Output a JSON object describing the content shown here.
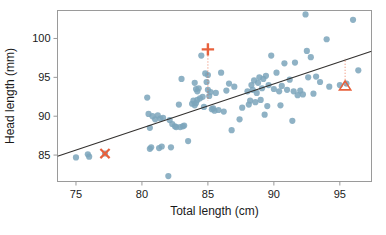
{
  "chart_data": {
    "type": "scatter",
    "title": "",
    "xlabel": "Total length (cm)",
    "ylabel": "Head length (mm)",
    "xlim": [
      73.6,
      97.4
    ],
    "ylim": [
      81.6,
      103.6
    ],
    "xticks": [
      75,
      80,
      85,
      90,
      95
    ],
    "yticks": [
      85,
      90,
      95,
      100
    ],
    "xtick_labels": [
      "75",
      "80",
      "85",
      "90",
      "95"
    ],
    "ytick_labels": [
      "85",
      "90",
      "95",
      "100"
    ],
    "grid": false,
    "legend": "none",
    "point_color": "#7ba4bb",
    "point_opacity": 0.85,
    "point_radius": 3.1,
    "highlight_color": "#e8613c",
    "line_color": "#33312f",
    "frame_color": "#9a9a9a",
    "series": [
      {
        "name": "possums",
        "x": [
          75.0,
          75.9,
          76.0,
          77.2,
          80.4,
          80.5,
          80.6,
          80.6,
          80.7,
          80.8,
          81.0,
          81.2,
          81.3,
          81.4,
          81.5,
          81.6,
          82.0,
          82.1,
          82.2,
          82.3,
          82.5,
          82.6,
          82.8,
          82.9,
          83.0,
          83.1,
          83.2,
          83.5,
          83.8,
          83.9,
          84.0,
          84.0,
          84.1,
          84.1,
          84.2,
          84.2,
          84.3,
          84.4,
          84.5,
          84.6,
          84.7,
          84.8,
          84.9,
          85.0,
          85.0,
          85.1,
          85.2,
          85.3,
          85.4,
          85.5,
          85.6,
          85.8,
          86.0,
          86.2,
          86.4,
          86.6,
          86.8,
          87.0,
          87.4,
          87.6,
          88.0,
          88.1,
          88.2,
          88.3,
          88.4,
          88.5,
          88.6,
          88.7,
          88.8,
          88.9,
          89.0,
          89.1,
          89.2,
          89.3,
          89.4,
          89.5,
          89.6,
          89.8,
          90.0,
          90.2,
          90.4,
          90.5,
          90.6,
          90.8,
          91.0,
          91.2,
          91.4,
          91.5,
          91.6,
          91.8,
          92.0,
          92.2,
          92.4,
          92.5,
          92.6,
          92.8,
          93.0,
          93.2,
          93.5,
          94.0,
          94.2,
          95.0,
          95.5,
          96.0,
          96.4
        ],
        "y": [
          84.7,
          85.1,
          84.8,
          85.2,
          92.4,
          90.3,
          88.5,
          85.8,
          86.0,
          90.0,
          89.6,
          90.1,
          85.9,
          89.7,
          86.1,
          89.8,
          82.3,
          89.5,
          86.0,
          89.0,
          88.7,
          88.6,
          91.5,
          88.6,
          94.8,
          88.7,
          88.8,
          86.8,
          91.6,
          92.0,
          94.3,
          91.4,
          93.5,
          91.7,
          93.2,
          92.1,
          93.6,
          92.3,
          97.8,
          92.5,
          91.2,
          95.5,
          94.4,
          95.3,
          93.4,
          92.6,
          93.1,
          90.9,
          91.0,
          90.7,
          93.0,
          90.8,
          95.6,
          90.6,
          93.3,
          94.2,
          88.2,
          93.8,
          89.6,
          91.1,
          93.2,
          91.5,
          92.0,
          94.0,
          93.4,
          94.6,
          91.8,
          93.0,
          94.3,
          95.0,
          92.1,
          93.6,
          94.8,
          90.2,
          95.2,
          91.3,
          94.0,
          97.8,
          93.5,
          95.6,
          93.2,
          91.4,
          93.9,
          96.8,
          93.4,
          94.7,
          89.4,
          93.2,
          96.9,
          92.7,
          93.3,
          92.8,
          103.1,
          98.4,
          95.0,
          97.6,
          92.9,
          95.1,
          94.4,
          99.9,
          93.8,
          94.0,
          94.2,
          102.4,
          95.9
        ],
        "color": "#7ba4bb"
      }
    ],
    "regression_line": {
      "x": [
        73.6,
        97.4
      ],
      "y": [
        84.85,
        98.35
      ],
      "color": "#33312f",
      "width": 1.1
    },
    "annotations": [
      {
        "marker": "plus",
        "x": 85.0,
        "y": 98.6,
        "color": "#e8613c",
        "leader_to_y": 92.0,
        "leader_style": "dotted"
      },
      {
        "marker": "x",
        "x": 77.2,
        "y": 85.2,
        "color": "#e8613c"
      },
      {
        "marker": "triangle",
        "x": 95.4,
        "y": 93.9,
        "color": "#e8613c",
        "leader_to_y": 97.4,
        "leader_style": "dotted"
      }
    ]
  }
}
